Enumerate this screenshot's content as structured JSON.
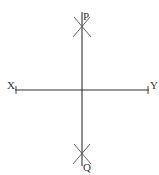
{
  "diagram": {
    "title": "",
    "labels": {
      "x_end": "X",
      "y_end": "Y",
      "top_point": "P",
      "bottom_point": "Q"
    },
    "colors": {
      "line": "#333333",
      "arc": "#555555",
      "background": "#ffffff"
    }
  }
}
